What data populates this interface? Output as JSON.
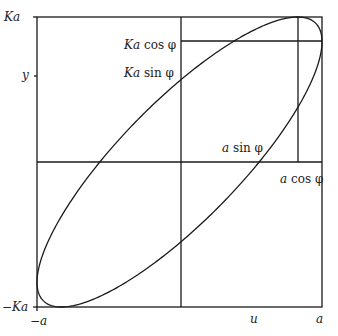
{
  "figure": {
    "type": "ellipse-in-rectangle",
    "phi_degrees": 34,
    "stroke_color": "#1a1a1a",
    "background": "#ffffff"
  },
  "axes": {
    "x_labels": [
      {
        "id": "minus-a",
        "sign": "−",
        "var": "a",
        "text": "−a"
      },
      {
        "id": "u",
        "var": "u",
        "text": "u"
      },
      {
        "id": "a",
        "var": "a",
        "text": "a"
      }
    ],
    "y_labels": [
      {
        "id": "Ka",
        "var": "Ka",
        "text": "Ka"
      },
      {
        "id": "y",
        "var": "y",
        "text": "y"
      },
      {
        "id": "minus-Ka",
        "sign": "−",
        "var": "Ka",
        "text": "−Ka"
      }
    ]
  },
  "annotations": {
    "ka_cos": {
      "var": "Ka",
      "fn": " cos φ",
      "text": "Ka cos φ"
    },
    "ka_sin": {
      "var": "Ka",
      "fn": " sin φ",
      "text": "Ka sin φ"
    },
    "a_sin": {
      "var": "a",
      "fn": " sin φ",
      "text": "a sin φ"
    },
    "a_cos": {
      "var": "a",
      "fn": " cos φ",
      "text": "a cos φ"
    }
  }
}
